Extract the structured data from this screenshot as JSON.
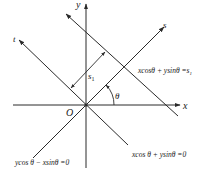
{
  "diagram": {
    "type": "coordinate-rotation-figure",
    "colors": {
      "line": "#2a2a2a",
      "text": "#1a1a1a",
      "background": "#ffffff"
    },
    "axes": {
      "x_label": "x",
      "y_label": "y",
      "s_label": "s",
      "t_label": "t",
      "origin_label": "O"
    },
    "angle_label": "θ",
    "distance_label": "s",
    "distance_subscript": "1",
    "equations": {
      "line_s1": {
        "lhs": "xcosθ + ysinθ =s",
        "sub": "1"
      },
      "line_zero": "xcos θ + ysinθ =0",
      "t_axis": "ycos θ − xsinθ =0"
    }
  }
}
